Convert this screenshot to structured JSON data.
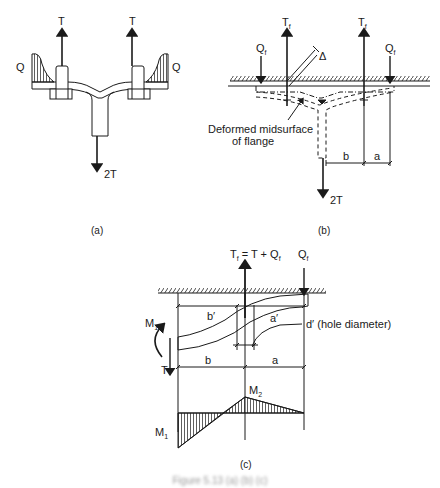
{
  "figure": {
    "caption": "Figure 5.13 (a) (b) (c)",
    "panels": {
      "a": {
        "label": "(a)",
        "forces": {
          "left_bolt": "T",
          "right_bolt": "T",
          "web": "2T",
          "left_pressure": "Q",
          "right_pressure": "Q"
        }
      },
      "b": {
        "label": "(b)",
        "forces": {
          "bolt_left": "T",
          "bolt_left_sub": "f",
          "bolt_right": "T",
          "bolt_right_sub": "f",
          "prying_left": "Q",
          "prying_left_sub": "f",
          "prying_right": "Q",
          "prying_right_sub": "f",
          "web": "2T"
        },
        "gap_symbol": "Δ",
        "annotation_line1": "Deformed midsurface",
        "annotation_line2": "of flange",
        "dimensions": {
          "b": "b",
          "a": "a"
        }
      },
      "c": {
        "label": "(c)",
        "bolt_eq_T": "T",
        "bolt_eq_sub": "f",
        "bolt_eq_rest": " = T + Q",
        "bolt_eq_sub2": "f",
        "prying": "Q",
        "prying_sub": "f",
        "moment_left": "M",
        "moment_left_sub": "1",
        "tension": "T",
        "dims": {
          "b_prime": "b′",
          "a_prime": "a′",
          "b": "b",
          "a": "a"
        },
        "hole_label": "d′ (hole diameter)",
        "moment_diagram": {
          "M1": "M",
          "M1_sub": "1",
          "M2": "M",
          "M2_sub": "2"
        }
      }
    }
  }
}
